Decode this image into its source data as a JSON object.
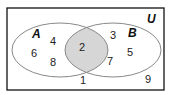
{
  "diagram": {
    "type": "venn",
    "universe_label": "U",
    "sets": [
      {
        "label": "A",
        "only": [
          "4",
          "6",
          "8"
        ]
      },
      {
        "label": "B",
        "only": [
          "3",
          "5",
          "7"
        ]
      }
    ],
    "intersection": [
      "2"
    ],
    "outside": [
      "1",
      "9"
    ],
    "colors": {
      "border": "#111111",
      "circle_stroke": "#888888",
      "intersection_fill": "#d6d6d6"
    }
  },
  "labels": {
    "U": "U",
    "A": "A",
    "B": "B",
    "n4": "4",
    "n6": "6",
    "n8": "8",
    "n2": "2",
    "n3": "3",
    "n5": "5",
    "n7": "7",
    "n1": "1",
    "n9": "9"
  }
}
